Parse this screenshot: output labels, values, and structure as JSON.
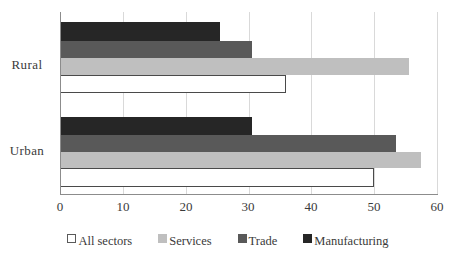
{
  "chart_data": {
    "type": "bar",
    "orientation": "horizontal",
    "title": "",
    "xlabel": "",
    "ylabel": "",
    "categories": [
      "Urban",
      "Rural"
    ],
    "xlim": [
      0,
      60
    ],
    "xticks": [
      0,
      10,
      20,
      30,
      40,
      50,
      60
    ],
    "xtick_labels": [
      "0",
      "10",
      "20",
      "30",
      "40",
      "50",
      "60"
    ],
    "grid": true,
    "legend_position": "bottom",
    "series": [
      {
        "name": "All sectors",
        "key": "allsectors",
        "color": "#ffffff",
        "border_color": "#4a4a4a",
        "values": [
          50,
          36
        ]
      },
      {
        "name": "Services",
        "key": "services",
        "color": "#bfbfbf",
        "values": [
          57.5,
          55.5
        ]
      },
      {
        "name": "Trade",
        "key": "trade",
        "color": "#595959",
        "values": [
          53.5,
          30.5
        ]
      },
      {
        "name": "Manufacturing",
        "key": "manufacturing",
        "color": "#262626",
        "values": [
          30.5,
          25.5
        ]
      }
    ]
  },
  "axis": {
    "y_labels": [
      {
        "text": "Rural",
        "top": 57
      },
      {
        "text": "Urban",
        "top": 143
      }
    ],
    "x_tick_labels": [
      {
        "text": "0",
        "left": 60
      },
      {
        "text": "10",
        "left": 123
      },
      {
        "text": "20",
        "left": 186
      },
      {
        "text": "30",
        "left": 248
      },
      {
        "text": "40",
        "left": 311
      },
      {
        "text": "50",
        "left": 374
      },
      {
        "text": "60",
        "left": 437
      }
    ]
  },
  "bars": [
    {
      "group": "Rural",
      "series": "Manufacturing",
      "key": "manufacturing",
      "value": 25.5,
      "top": 22,
      "height": 19
    },
    {
      "group": "Rural",
      "series": "Trade",
      "key": "trade",
      "value": 30.5,
      "top": 41,
      "height": 17
    },
    {
      "group": "Rural",
      "series": "Services",
      "key": "services",
      "value": 55.5,
      "top": 58,
      "height": 17
    },
    {
      "group": "Rural",
      "series": "All sectors",
      "key": "allsectors",
      "value": 36.0,
      "top": 75,
      "height": 18
    },
    {
      "group": "Urban",
      "series": "Manufacturing",
      "key": "manufacturing",
      "value": 30.5,
      "top": 117,
      "height": 18
    },
    {
      "group": "Urban",
      "series": "Trade",
      "key": "trade",
      "value": 53.5,
      "top": 135,
      "height": 17
    },
    {
      "group": "Urban",
      "series": "Services",
      "key": "services",
      "value": 57.5,
      "top": 152,
      "height": 16
    },
    {
      "group": "Urban",
      "series": "All sectors",
      "key": "allsectors",
      "value": 50.0,
      "top": 168,
      "height": 19
    }
  ],
  "legend": {
    "items": [
      {
        "label": "All sectors",
        "key": "allsectors"
      },
      {
        "label": "Services",
        "key": "services"
      },
      {
        "label": "Trade",
        "key": "trade"
      },
      {
        "label": "Manufacturing",
        "key": "manufacturing"
      }
    ]
  }
}
